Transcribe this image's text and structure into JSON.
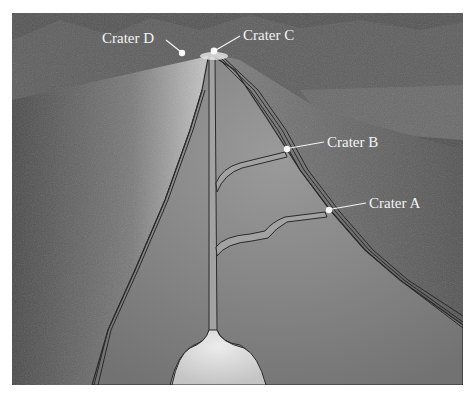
{
  "figure": {
    "colors": {
      "background": "#ffffff",
      "terrain_dark": "#4a4a4a",
      "terrain_mid": "#6e6e6e",
      "cutaway_fill": "#8a8a8a",
      "conduit_fill": "#a8a8a8",
      "magma_chamber": "#d8d8d8",
      "label_text": "#f4f4f4",
      "outline": "#2a2a2a"
    }
  },
  "labels": [
    {
      "id": "crater-d",
      "text": "Crater D",
      "x": 102,
      "y": 43,
      "pointer_end": [
        182,
        53
      ]
    },
    {
      "id": "crater-c",
      "text": "Crater C",
      "x": 243,
      "y": 40,
      "pointer_end": [
        214,
        51
      ]
    },
    {
      "id": "crater-b",
      "text": "Crater B",
      "x": 327,
      "y": 147,
      "pointer_end": [
        287,
        149
      ]
    },
    {
      "id": "crater-a",
      "text": "Crater A",
      "x": 369,
      "y": 208,
      "pointer_end": [
        329,
        210
      ]
    }
  ]
}
